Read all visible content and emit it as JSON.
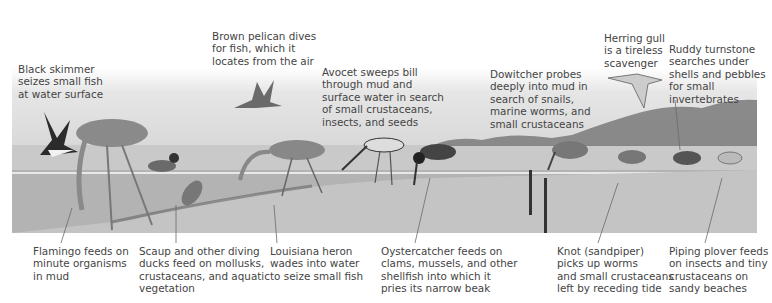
{
  "figure": {
    "type": "labeled illustration",
    "colors": {
      "sky_top": "#ffffff",
      "sky_bottom": "#d4d4d4",
      "water": "#b3b3b3",
      "sand": "#c9c9c9",
      "hills": "#7a7a7a",
      "text": "#444444",
      "leader_line": "#6a6a6a"
    }
  },
  "labels_top": [
    {
      "id": "black-skimmer",
      "text": "Black skimmer\nseizes small fish\nat water surface"
    },
    {
      "id": "brown-pelican",
      "text": "Brown pelican dives\nfor fish, which it\nlocates from the air"
    },
    {
      "id": "avocet",
      "text": "Avocet sweeps bill\nthrough mud and\nsurface water in search\nof small crustaceans,\ninsects, and seeds"
    },
    {
      "id": "dowitcher",
      "text": "Dowitcher probes\ndeeply into mud in\nsearch of snails,\nmarine worms, and\nsmall crustaceans"
    },
    {
      "id": "herring-gull",
      "text": "Herring gull\nis a tireless\nscavenger"
    },
    {
      "id": "ruddy-turnstone",
      "text": "Ruddy turnstone\nsearches under\nshells and pebbles\nfor small\ninvertebrates"
    }
  ],
  "labels_bottom": [
    {
      "id": "flamingo",
      "text": "Flamingo feeds on\nminute organisms\nin mud"
    },
    {
      "id": "scaup",
      "text": "Scaup and other diving\nducks feed on mollusks,\ncrustaceans, and aquatic\nvegetation"
    },
    {
      "id": "louisiana-heron",
      "text": "Louisiana heron\nwades into water\nto seize small fish"
    },
    {
      "id": "oystercatcher",
      "text": "Oystercatcher feeds on\nclams, mussels, and other\nshellfish into which it\npries its narrow beak"
    },
    {
      "id": "knot",
      "text": "Knot (sandpiper)\npicks up worms\nand small crustaceans\nleft by receding tide"
    },
    {
      "id": "piping-plover",
      "text": "Piping plover feeds\non insects and tiny\ncrustaceans on\nsandy beaches"
    }
  ]
}
